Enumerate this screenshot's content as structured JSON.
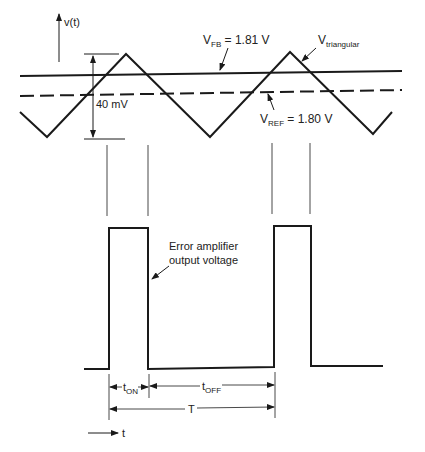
{
  "axes": {
    "y_label": "v(t)",
    "x_label": "t"
  },
  "labels": {
    "vfb": {
      "main": "V",
      "sub": "FB",
      "value": " = 1.81 V"
    },
    "vref": {
      "main": "V",
      "sub": "REF",
      "value": " = 1.80 V"
    },
    "vtri": {
      "main": "V",
      "sub": "triangular"
    },
    "ripple": "40 mV",
    "error_amp_line1": "Error amplifier",
    "error_amp_line2": "output voltage",
    "ton": {
      "main": "t",
      "sub": "ON"
    },
    "toff": {
      "main": "t",
      "sub": "OFF"
    },
    "period": "T"
  },
  "colors": {
    "ink": "#1a1a1a",
    "background": "#ffffff"
  }
}
